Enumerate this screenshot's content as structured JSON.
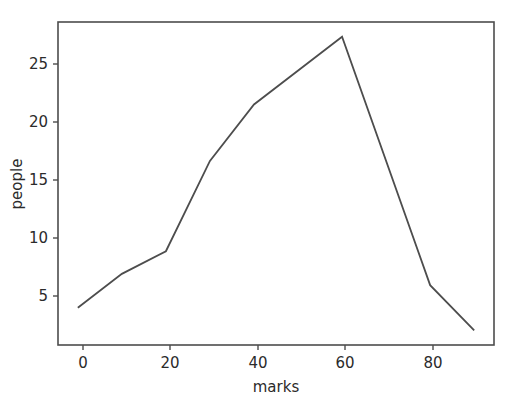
{
  "chart_data": {
    "type": "line",
    "title": "",
    "xlabel": "marks",
    "ylabel": "people",
    "x": [
      0,
      10,
      20,
      30,
      40,
      60,
      80,
      90
    ],
    "values": [
      4,
      7,
      9,
      17,
      22,
      28,
      6,
      2
    ],
    "series": [
      {
        "name": "people",
        "x": [
          0,
          10,
          20,
          30,
          40,
          60,
          80,
          90
        ],
        "values": [
          4,
          7,
          9,
          17,
          22,
          28,
          6,
          2
        ]
      }
    ],
    "xlim": [
      -4.5,
      94.5
    ],
    "ylim": [
      0.7,
      29.3
    ],
    "xticks": [
      0,
      20,
      40,
      60,
      80
    ],
    "xticklabels": [
      "0",
      "20",
      "40",
      "60",
      "80"
    ],
    "yticks": [
      5,
      10,
      15,
      20,
      25
    ],
    "yticklabels": [
      "5",
      "10",
      "15",
      "20",
      "25"
    ],
    "grid": false,
    "legend": null,
    "line_color": "#4d4d4d",
    "background_color": "#ffffff"
  },
  "axes": {
    "x_label": "marks",
    "y_label": "people"
  }
}
